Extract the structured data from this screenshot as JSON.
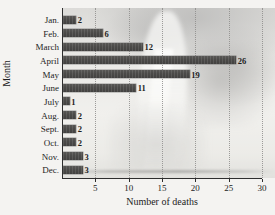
{
  "chart_data": {
    "type": "bar",
    "orientation": "horizontal",
    "title": "",
    "xlabel": "Number of deaths",
    "ylabel": "Month",
    "categories": [
      "Jan.",
      "Feb.",
      "March",
      "April",
      "May",
      "June",
      "July",
      "Aug.",
      "Sept.",
      "Oct.",
      "Nov.",
      "Dec."
    ],
    "values": [
      2,
      6,
      12,
      26,
      19,
      11,
      1,
      2,
      2,
      2,
      3,
      3
    ],
    "data_labels": [
      "2",
      "6",
      "12",
      "26",
      "19",
      "11",
      "1",
      "2",
      "2",
      "2",
      "3",
      "3"
    ],
    "xlim": [
      0,
      30
    ],
    "xticks": [
      5,
      10,
      15,
      20,
      25,
      30
    ],
    "xtick_labels": [
      "5",
      "10",
      "15",
      "20",
      "25",
      "30"
    ],
    "grid": "vertical-dotted",
    "legend": "none",
    "bar_color": "#4b4a48",
    "axis_color": "#2e2e2e",
    "gridline_color": "#8e8d8b",
    "background": "faded tornado photograph"
  },
  "icons": {
    "tornado_funnel": "tornado-funnel-icon",
    "storm_clouds": "storm-clouds-icon"
  }
}
